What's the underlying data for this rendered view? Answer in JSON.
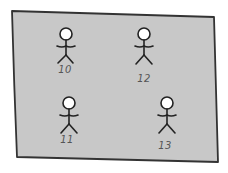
{
  "panel": {
    "fill": "#c8c8c8",
    "stroke": "#333333"
  },
  "figures": [
    {
      "id": "10",
      "label": "10",
      "head": [
        66,
        34
      ],
      "label_pos": [
        65,
        73
      ]
    },
    {
      "id": "12",
      "label": "12",
      "head": [
        144,
        34
      ],
      "label_pos": [
        144,
        82
      ]
    },
    {
      "id": "11",
      "label": "11",
      "head": [
        69,
        103
      ],
      "label_pos": [
        67,
        143
      ]
    },
    {
      "id": "13",
      "label": "13",
      "head": [
        167,
        103
      ],
      "label_pos": [
        165,
        149
      ]
    }
  ]
}
